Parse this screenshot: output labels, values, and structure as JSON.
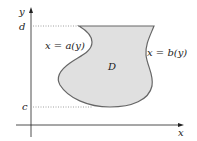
{
  "figure": {
    "axes": {
      "x_label": "x",
      "y_label": "y"
    },
    "ticks": {
      "top": "d",
      "bottom": "c"
    },
    "region_label": "D",
    "left_curve_label": "x = a(y)",
    "right_curve_label": "x = b(y)",
    "colors": {
      "region_fill": "#e0e0e0",
      "region_stroke": "#666666",
      "axis": "#222222",
      "dotted": "#888888"
    }
  }
}
